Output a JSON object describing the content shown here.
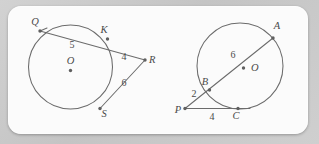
{
  "card": {
    "background_color": "#fbfbfb",
    "page_background_color": "#c9c9c9"
  },
  "figure": {
    "stroke_color": "#6b6b6b",
    "label_color": "#4a4a4a",
    "caption": "Two circle geometry diagrams: secant-secant and secant-tangent configurations"
  },
  "left_diagram": {
    "name": "circle-secant-secant-R",
    "circle": {
      "cx": 70.5,
      "cy": 67,
      "r": 42
    },
    "center_label": "O",
    "points": [
      {
        "label": "Q",
        "x": 40,
        "y": 31,
        "label_x": 35,
        "label_y": 25
      },
      {
        "label": "K",
        "x": 107.5,
        "y": 39,
        "label_x": 104,
        "label_y": 33
      },
      {
        "label": "R",
        "x": 145,
        "y": 60,
        "label_x": 149,
        "label_y": 63
      },
      {
        "label": "S",
        "x": 100,
        "y": 108.5,
        "label_x": 104,
        "label_y": 117
      }
    ],
    "segment_labels": [
      {
        "value": "5",
        "x": 72,
        "y": 48
      },
      {
        "value": "4",
        "x": 124,
        "y": 60
      },
      {
        "value": "6",
        "x": 124,
        "y": 86
      }
    ],
    "segments": [
      {
        "from": "Q",
        "to": "R",
        "type": "secant-through-K"
      },
      {
        "from": "R",
        "to": "S",
        "type": "secant-to-S"
      }
    ]
  },
  "right_diagram": {
    "name": "circle-secant-tangent-P",
    "circle": {
      "cx": 240,
      "cy": 66,
      "r": 43
    },
    "center_label": "O",
    "points": [
      {
        "label": "A",
        "x": 273,
        "y": 38,
        "label_x": 277,
        "label_y": 29
      },
      {
        "label": "B",
        "x": 209.5,
        "y": 90,
        "label_x": 205,
        "label_y": 85
      },
      {
        "label": "P",
        "x": 185,
        "y": 108.5,
        "label_x": 177,
        "label_y": 113
      },
      {
        "label": "C",
        "x": 238,
        "y": 108.5,
        "label_x": 235,
        "label_y": 119
      }
    ],
    "segment_labels": [
      {
        "value": "6",
        "x": 233,
        "y": 58
      },
      {
        "value": "2",
        "x": 194,
        "y": 96
      },
      {
        "value": "4",
        "x": 212,
        "y": 119
      }
    ],
    "segments": [
      {
        "from": "P",
        "to": "A",
        "type": "secant-through-B"
      },
      {
        "from": "P",
        "to": "C",
        "type": "tangent"
      }
    ]
  }
}
